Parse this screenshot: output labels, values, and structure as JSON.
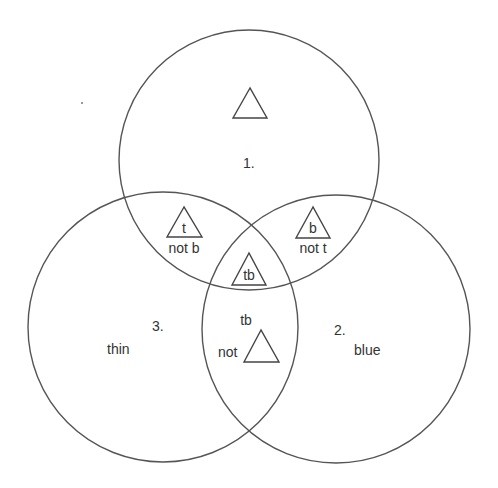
{
  "diagram": {
    "type": "venn",
    "colors": {
      "stroke": "#555555",
      "text": "#333333",
      "background": "#ffffff"
    },
    "circles": [
      {
        "id": "1",
        "label": "1.",
        "descriptor": ""
      },
      {
        "id": "2",
        "label": "2.",
        "descriptor": "blue"
      },
      {
        "id": "3",
        "label": "3.",
        "descriptor": "thin"
      }
    ],
    "regions": {
      "top_only": {
        "symbol": "triangle-icon",
        "text": ""
      },
      "top_left": {
        "symbol": "triangle-icon",
        "inner": "t",
        "caption": "not b"
      },
      "top_right": {
        "symbol": "triangle-icon",
        "inner": "b",
        "caption": "not t"
      },
      "center": {
        "symbol": "triangle-icon",
        "inner": "tb"
      },
      "left_right": {
        "symbol": "triangle-icon",
        "above": "tb",
        "prefix": "not"
      }
    }
  }
}
